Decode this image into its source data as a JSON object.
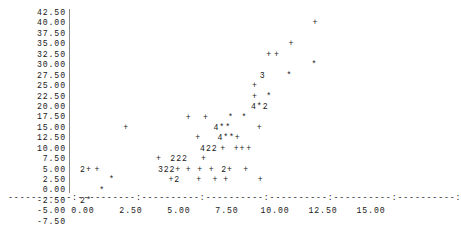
{
  "chart_data": {
    "type": "scatter",
    "title": "",
    "subtitle": "",
    "xlabel": "",
    "ylabel": "",
    "xlim": [
      -1.0,
      16.2
    ],
    "ylim": [
      -7.5,
      42.5
    ],
    "grid": false,
    "legend": null,
    "style": "ascii-character-cell",
    "marker_plain": "+",
    "marker_dense": "*",
    "overplot_note": "Digits mark the number of coincident observations in one character cell; '*' marks 2 or more where rendered as star.",
    "y_ticks": [
      42.5,
      40.0,
      37.5,
      35.0,
      32.5,
      30.0,
      27.5,
      25.0,
      22.5,
      20.0,
      17.5,
      15.0,
      12.5,
      10.0,
      7.5,
      5.0,
      2.5,
      0.0,
      -2.5,
      -5.0,
      -7.5
    ],
    "y_tick_labels": [
      "42.50",
      "40.00",
      "37.50",
      "35.00",
      "32.50",
      "30.00",
      "27.50",
      "25.00",
      "22.50",
      "20.00",
      "17.50",
      "15.00",
      "12.50",
      "10.00",
      "7.50",
      "5.00",
      "2.50",
      "0.00",
      "-2.50",
      "-5.00",
      "-7.50"
    ],
    "x_ticks": [
      0.0,
      2.5,
      5.0,
      7.5,
      10.0,
      12.5,
      15.0
    ],
    "x_tick_labels": [
      "0.00",
      "2.50",
      "5.00",
      "7.50",
      "10.00",
      "12.50",
      "15.00"
    ],
    "rows": [
      {
        "y": 40.0,
        "cells": [
          {
            "x": 11.95,
            "text": "+"
          }
        ]
      },
      {
        "y": 35.0,
        "cells": [
          {
            "x": 10.7,
            "text": "+"
          }
        ]
      },
      {
        "y": 32.5,
        "cells": [
          {
            "x": 9.55,
            "text": "+"
          },
          {
            "x": 9.95,
            "text": "+"
          }
        ]
      },
      {
        "y": 30.0,
        "cells": [
          {
            "x": 11.9,
            "text": "*"
          }
        ]
      },
      {
        "y": 27.5,
        "cells": [
          {
            "x": 9.2,
            "text": "3"
          },
          {
            "x": 10.6,
            "text": "*"
          }
        ]
      },
      {
        "y": 25.0,
        "cells": [
          {
            "x": 8.8,
            "text": "+"
          }
        ]
      },
      {
        "y": 22.5,
        "cells": [
          {
            "x": 8.8,
            "text": "+"
          },
          {
            "x": 9.55,
            "text": "*"
          }
        ]
      },
      {
        "y": 20.0,
        "cells": [
          {
            "x": 8.75,
            "text": "4*2"
          }
        ]
      },
      {
        "y": 17.5,
        "cells": [
          {
            "x": 5.35,
            "text": "+"
          },
          {
            "x": 6.25,
            "text": "+"
          },
          {
            "x": 7.55,
            "text": "*"
          },
          {
            "x": 8.25,
            "text": "*"
          }
        ]
      },
      {
        "y": 15.0,
        "cells": [
          {
            "x": 2.1,
            "text": "+"
          },
          {
            "x": 6.8,
            "text": "4**"
          },
          {
            "x": 9.05,
            "text": "+"
          }
        ]
      },
      {
        "y": 12.5,
        "cells": [
          {
            "x": 5.85,
            "text": "+"
          },
          {
            "x": 7.0,
            "text": "4**+"
          }
        ]
      },
      {
        "y": 10.0,
        "cells": [
          {
            "x": 6.1,
            "text": "422"
          },
          {
            "x": 7.15,
            "text": "+"
          },
          {
            "x": 7.85,
            "text": "++"
          },
          {
            "x": 8.5,
            "text": "+"
          }
        ]
      },
      {
        "y": 7.5,
        "cells": [
          {
            "x": 3.8,
            "text": "+"
          },
          {
            "x": 4.55,
            "text": "222"
          },
          {
            "x": 6.15,
            "text": "+"
          }
        ]
      },
      {
        "y": 5.0,
        "cells": [
          {
            "x": -0.15,
            "text": "2+"
          },
          {
            "x": 0.6,
            "text": "+"
          },
          {
            "x": 3.9,
            "text": "322+"
          },
          {
            "x": 5.35,
            "text": "+"
          },
          {
            "x": 5.95,
            "text": "+"
          },
          {
            "x": 6.55,
            "text": "+"
          },
          {
            "x": 7.2,
            "text": "2+"
          },
          {
            "x": 8.35,
            "text": "+"
          }
        ]
      },
      {
        "y": 2.5,
        "cells": [
          {
            "x": 1.35,
            "text": "*"
          },
          {
            "x": 4.45,
            "text": "+2"
          },
          {
            "x": 5.9,
            "text": "+"
          },
          {
            "x": 6.75,
            "text": "+"
          },
          {
            "x": 7.3,
            "text": "+"
          },
          {
            "x": 9.1,
            "text": "+"
          }
        ]
      },
      {
        "y": 0.0,
        "cells": [
          {
            "x": 0.85,
            "text": "*"
          }
        ]
      },
      {
        "y": -2.5,
        "cells": [
          {
            "x": -0.15,
            "text": "2*"
          }
        ]
      }
    ]
  },
  "axis": {
    "x_rule": "-----------:----------:----------:----------:----------:----------:----------:",
    "y_rule_name": "vertical-axis-rule"
  }
}
